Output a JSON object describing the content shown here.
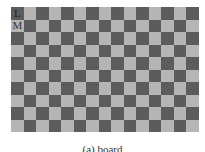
{
  "board": {
    "columns": 15,
    "rows": 10,
    "colors": {
      "dark": "#5c5c5c",
      "light": "#b5b5b5"
    },
    "first_cell": "dark",
    "labels": [
      {
        "row": 0,
        "col": 0,
        "text": "L"
      },
      {
        "row": 1,
        "col": 0,
        "text": "M"
      }
    ]
  },
  "caption": "(a) board"
}
